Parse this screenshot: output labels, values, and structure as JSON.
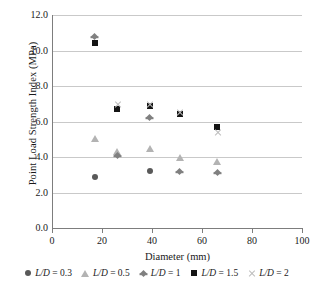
{
  "chart_data": {
    "type": "scatter",
    "title": "",
    "xlabel": "Diameter (mm)",
    "ylabel": "Point Load Strength Index (MPa)",
    "xlim": [
      0,
      100
    ],
    "ylim": [
      0,
      12
    ],
    "xticks": [
      "0",
      "20",
      "40",
      "60",
      "80",
      "100"
    ],
    "yticks": [
      "0.0",
      "2.0",
      "4.0",
      "6.0",
      "8.0",
      "10.0",
      "12.0"
    ],
    "grid": "horizontal",
    "legend_position": "bottom",
    "series": [
      {
        "name": "L/D = 0.3",
        "marker": "circle",
        "color": "#595959",
        "points": [
          {
            "x": 17,
            "y": 2.9
          },
          {
            "x": 39,
            "y": 3.2
          }
        ]
      },
      {
        "name": "L/D = 0.5",
        "marker": "triangle",
        "color": "#b3b3b3",
        "points": [
          {
            "x": 17,
            "y": 5.05
          },
          {
            "x": 26,
            "y": 4.3
          },
          {
            "x": 39,
            "y": 4.5
          },
          {
            "x": 51,
            "y": 4.0
          },
          {
            "x": 66,
            "y": 3.75
          }
        ]
      },
      {
        "name": "L/D = 1",
        "marker": "diamond",
        "color": "#808080",
        "points": [
          {
            "x": 17,
            "y": 10.8
          },
          {
            "x": 26,
            "y": 4.1
          },
          {
            "x": 39,
            "y": 6.2
          },
          {
            "x": 51,
            "y": 3.2
          },
          {
            "x": 66,
            "y": 3.1
          }
        ]
      },
      {
        "name": "L/D = 1.5",
        "marker": "square",
        "color": "#141414",
        "points": [
          {
            "x": 17,
            "y": 10.4
          },
          {
            "x": 26,
            "y": 6.7
          },
          {
            "x": 39,
            "y": 6.9
          },
          {
            "x": 51,
            "y": 6.4
          },
          {
            "x": 66,
            "y": 5.7
          }
        ]
      },
      {
        "name": "L/D = 2",
        "marker": "cross",
        "color": "#bdbdbd",
        "points": [
          {
            "x": 26,
            "y": 6.95
          },
          {
            "x": 39,
            "y": 6.95
          },
          {
            "x": 51,
            "y": 6.5
          },
          {
            "x": 66,
            "y": 5.4
          }
        ]
      }
    ]
  },
  "legend": {
    "items": [
      {
        "label_prefix": "L/D",
        "label_suffix": " = 0.3",
        "marker": "circle"
      },
      {
        "label_prefix": "L/D",
        "label_suffix": " = 0.5",
        "marker": "triangle"
      },
      {
        "label_prefix": "L/D",
        "label_suffix": " = 1",
        "marker": "diamond"
      },
      {
        "label_prefix": "L/D",
        "label_suffix": " = 1.5",
        "marker": "square"
      },
      {
        "label_prefix": "L/D",
        "label_suffix": " = 2",
        "marker": "cross"
      }
    ]
  }
}
